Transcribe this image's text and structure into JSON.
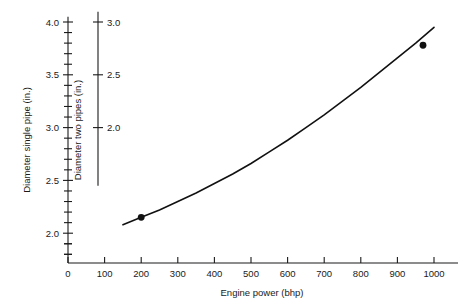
{
  "chart_data": {
    "type": "line",
    "title": "",
    "xlabel": "Engine power (bhp)",
    "ylabel": "Diameter single pipe (in.)",
    "ylabel2": "Diameter two pipes (in.)",
    "xlim": [
      0,
      1000
    ],
    "ylim": [
      1.55,
      4.05
    ],
    "ylim2": [
      1.45,
      3.05
    ],
    "grid": false,
    "legend": null,
    "xticks": [
      0,
      100,
      200,
      300,
      400,
      500,
      600,
      700,
      800,
      900,
      1000
    ],
    "xticklabels": [
      "0",
      "100",
      "200",
      "300",
      "400",
      "500",
      "600",
      "700",
      "800",
      "900",
      "1000"
    ],
    "yticks_major": [
      2.0,
      2.5,
      3.0,
      3.5,
      4.0
    ],
    "yticklabels": [
      "2.0",
      "2.5",
      "3.0",
      "3.5",
      "4.0"
    ],
    "yticks_minor": [
      1.6,
      1.7,
      1.8,
      1.9,
      2.1,
      2.2,
      2.3,
      2.4,
      2.6,
      2.7,
      2.8,
      2.9,
      3.1,
      3.2,
      3.3,
      3.4,
      3.6,
      3.7,
      3.8,
      3.9
    ],
    "y2ticks_major": [
      2.0,
      2.5,
      3.0
    ],
    "y2ticklabels": [
      "2.0",
      "2.5",
      "3.0"
    ],
    "series": [
      {
        "name": "Exhaust pipe diameter vs engine power",
        "x": [
          150,
          200,
          250,
          300,
          350,
          400,
          450,
          500,
          550,
          600,
          650,
          700,
          750,
          800,
          850,
          900,
          950,
          1000
        ],
        "y": [
          2.08,
          2.15,
          2.22,
          2.3,
          2.38,
          2.47,
          2.56,
          2.66,
          2.77,
          2.88,
          3.0,
          3.12,
          3.25,
          3.38,
          3.52,
          3.66,
          3.8,
          3.95
        ]
      }
    ],
    "markers": [
      {
        "x": 200,
        "y": 2.15,
        "label": ""
      },
      {
        "x": 970,
        "y": 3.78,
        "label": ""
      }
    ]
  }
}
